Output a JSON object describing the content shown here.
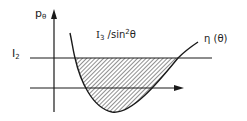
{
  "diagram": {
    "axis_label_y": "p",
    "axis_label_y_sub": "θ",
    "level_label": "I",
    "level_label_sub": "2",
    "curve_label_main": "I",
    "curve_label_sub": "3",
    "curve_label_rest": " /sin",
    "curve_label_sup": "2",
    "curve_label_end": "θ",
    "eta_label": "η (θ)",
    "colors": {
      "ink": "#1a1a1a",
      "background": "#ffffff",
      "hatch": "#333333"
    }
  }
}
